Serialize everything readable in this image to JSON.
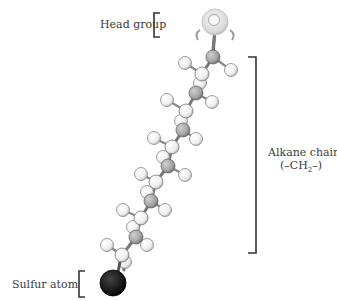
{
  "labels": {
    "head_group": "Head group",
    "alkane_chain": "Alkane chain",
    "alkane_formula": "(–CH",
    "alkane_formula_sub": "2",
    "alkane_formula_end": "–)",
    "sulfur_atom": "Sulfur atom"
  },
  "colors": {
    "carbon": "#a9a9a9",
    "hydrogen": "#f2f2f2",
    "sulfur": "#1c1c1c",
    "head": "#d9d9d9",
    "bracket": "#333333"
  }
}
